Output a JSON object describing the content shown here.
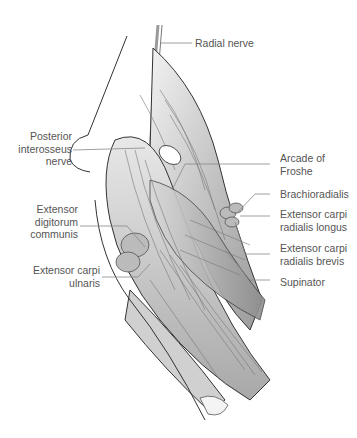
{
  "figure": {
    "labels": {
      "radial_nerve": "Radial nerve",
      "posterior_interosseus_nerve": [
        "Posterior",
        "interosseus",
        "nerve"
      ],
      "extensor_digitorum_communis": [
        "Extensor",
        "digitorum",
        "communis"
      ],
      "extensor_carpi_ulnaris": [
        "Extensor carpi",
        "ulnaris"
      ],
      "arcade_of_froshe": [
        "Arcade of",
        "Froshe"
      ],
      "brachioradialis": "Brachioradialis",
      "extensor_carpi_radialis_longus": [
        "Extensor carpi",
        "radialis longus"
      ],
      "extensor_carpi_radialis_brevis": [
        "Extensor carpi",
        "radialis brevis"
      ],
      "supinator": "Supinator"
    },
    "colors": {
      "label_text": "#555555",
      "leader_line": "#888888",
      "outline": "#333333",
      "muscle_light": "#e6e6e6",
      "muscle_mid": "#bdbdbd",
      "muscle_dark": "#8f8f8f"
    }
  }
}
